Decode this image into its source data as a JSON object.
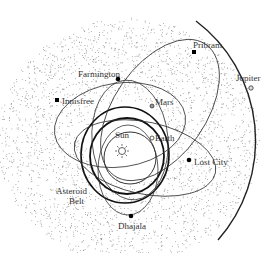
{
  "diagram": {
    "center": {
      "label": "Sun",
      "icon": "sun-icon"
    },
    "planets": [
      {
        "label": "Earth",
        "marker": "open-circle"
      },
      {
        "label": "Mars",
        "marker": "open-circle"
      },
      {
        "label": "Jupiter",
        "marker": "open-circle"
      }
    ],
    "meteorites": [
      {
        "label": "Pribram",
        "marker": "filled-square"
      },
      {
        "label": "Farmington",
        "marker": "filled-circle"
      },
      {
        "label": "Innisfree",
        "marker": "filled-square"
      },
      {
        "label": "Lost City",
        "marker": "filled-circle"
      },
      {
        "label": "Dhajala",
        "marker": "filled-circle"
      }
    ],
    "region": {
      "label_line1": "Asteroid",
      "label_line2": "Belt"
    },
    "colors": {
      "orbit": "#222222",
      "asteroid": "#888888",
      "text": "#333333",
      "background": "#ffffff"
    }
  }
}
